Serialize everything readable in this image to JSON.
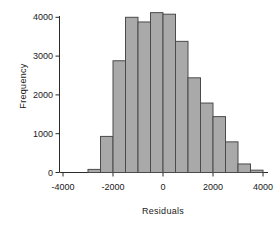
{
  "chart_data": {
    "type": "bar",
    "title": "",
    "subtitle": "",
    "xlabel": "Residuals",
    "ylabel": "Frequency",
    "grid": false,
    "legend": false,
    "legend_position": "none",
    "bar_style": "histogram",
    "bin_width": 500,
    "xlim": [
      -4400,
      4400
    ],
    "ylim": [
      0,
      4200
    ],
    "xticks": [
      -4000,
      -2000,
      0,
      2000,
      4000
    ],
    "xtick_labels": [
      "-4000",
      "-2000",
      "0",
      "2000",
      "4000"
    ],
    "yticks": [
      0,
      1000,
      2000,
      3000,
      4000
    ],
    "ytick_labels": [
      "0",
      "1000",
      "2000",
      "3000",
      "4000"
    ],
    "bin_edges": [
      -3000,
      -2500,
      -2000,
      -1500,
      -1000,
      -500,
      0,
      500,
      1000,
      1500,
      2000,
      2500,
      3000,
      3500,
      4000
    ],
    "bin_centers": [
      -2750,
      -2250,
      -1750,
      -1250,
      -750,
      -250,
      250,
      750,
      1250,
      1750,
      2250,
      2750,
      3250,
      3750
    ],
    "categories": [
      "-2750",
      "-2250",
      "-1750",
      "-1250",
      "-750",
      "-250",
      "250",
      "750",
      "1250",
      "1750",
      "2250",
      "2750",
      "3250",
      "3750"
    ],
    "values": [
      80,
      930,
      2880,
      4000,
      3880,
      4120,
      4080,
      3380,
      2440,
      1790,
      1440,
      790,
      220,
      60
    ],
    "colors": {
      "bar_fill": "#a9a9a9",
      "bar_edge": "#4a4a4a",
      "axis": "#2b2b2b",
      "background": "#ffffff",
      "text": "#1a1a1a"
    }
  }
}
